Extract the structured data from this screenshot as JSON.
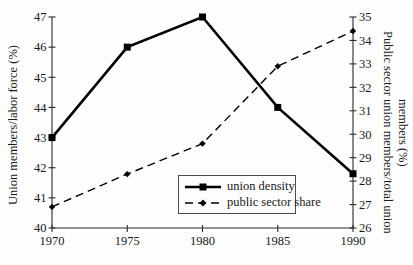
{
  "chart_data": {
    "type": "line",
    "title": "",
    "x": [
      1970,
      1975,
      1980,
      1985,
      1990
    ],
    "x_ticks": [
      "1970",
      "1975",
      "1980",
      "1985",
      "1990"
    ],
    "left_axis": {
      "label": "Union members/labor force (%)",
      "min": 40,
      "max": 47,
      "step": 1
    },
    "right_axis": {
      "label": "Public sector union members/total union members (%)",
      "label_lines": [
        "Public sector union members/total union",
        "members (%)"
      ],
      "min": 26,
      "max": 35,
      "step": 1
    },
    "series": [
      {
        "name": "union density",
        "axis": "left",
        "line": "solid",
        "marker": "square",
        "color": "#000000",
        "values": [
          43,
          46,
          47,
          44,
          41.8
        ]
      },
      {
        "name": "public sector share",
        "axis": "right",
        "line": "dashed",
        "marker": "diamond",
        "color": "#000000",
        "values": [
          26.9,
          28.3,
          29.6,
          32.9,
          34.4
        ]
      }
    ],
    "legend": {
      "position": "inside-bottom-center",
      "border": true
    },
    "grid": false,
    "background": "#fdfdfd",
    "colors": {
      "axis": "#2b2b2b",
      "text": "#1a1a1a",
      "line": "#000000"
    }
  }
}
